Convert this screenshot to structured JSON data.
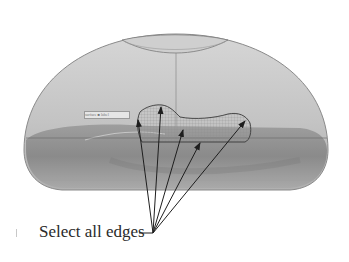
{
  "figure": {
    "callout": {
      "label": "Select all edges",
      "convergence_point": [
        153,
        233
      ],
      "arrow_tips": [
        [
          138,
          118
        ],
        [
          161,
          105
        ],
        [
          183,
          128
        ],
        [
          200,
          141
        ],
        [
          245,
          119
        ]
      ]
    },
    "inner_label": "surface ■ label",
    "colors": {
      "dome_light": "#c9c9c9",
      "dome_mid": "#b4b4b4",
      "base_dark": "#8a8a8a",
      "outline": "#6e6e6e",
      "arrow": "#1e1e1e",
      "text": "#2a2a2a"
    }
  }
}
